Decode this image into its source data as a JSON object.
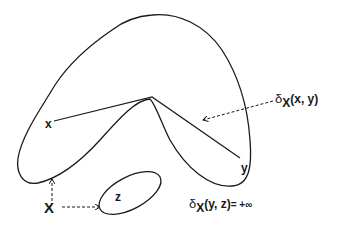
{
  "diagram": {
    "type": "set-distance-illustration",
    "stroke_color": "#1a1a1a",
    "background": "#ffffff",
    "shapes": [
      {
        "id": "main-region",
        "kind": "boomerang-shaped closed curve"
      },
      {
        "id": "small-region",
        "kind": "ellipse",
        "contains": "z"
      }
    ],
    "points": {
      "x": "x",
      "y": "y",
      "z": "z",
      "set": "X"
    },
    "labels": {
      "delta_xy": {
        "symbol": "δ",
        "subscript": "X",
        "args": "(x, y)"
      },
      "delta_yz": {
        "symbol": "δ",
        "subscript": "X",
        "args": "(y, z)",
        "equals": "= +∞"
      }
    },
    "edges": [
      {
        "from": "x",
        "to": "vertex",
        "style": "solid"
      },
      {
        "from": "vertex",
        "to": "y",
        "style": "solid"
      },
      {
        "from": "delta_xy",
        "to": "path x-y",
        "style": "dashed-arrow"
      },
      {
        "from": "X",
        "to": "main-region",
        "style": "dashed-arrow"
      },
      {
        "from": "X",
        "to": "small-region",
        "style": "dashed-arrow"
      }
    ]
  }
}
